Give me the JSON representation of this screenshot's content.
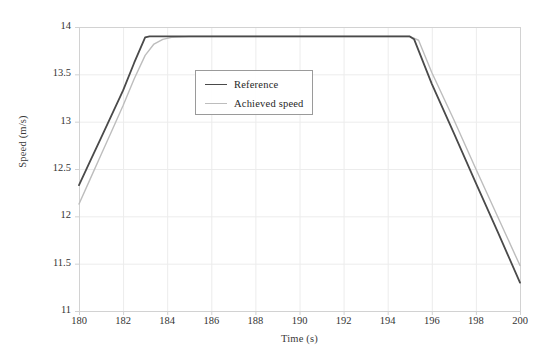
{
  "chart_data": {
    "type": "line",
    "title": "",
    "xlabel": "Time (s)",
    "ylabel": "Speed (m/s)",
    "xlim": [
      180,
      200
    ],
    "ylim": [
      11,
      14
    ],
    "xticks": [
      180,
      182,
      184,
      186,
      188,
      190,
      192,
      194,
      196,
      198,
      200
    ],
    "xtick_labels": [
      "180",
      "182",
      "184",
      "186",
      "188",
      "190",
      "192",
      "194",
      "196",
      "198",
      "200"
    ],
    "yticks": [
      11,
      11.5,
      12,
      12.5,
      13,
      13.5,
      14
    ],
    "ytick_labels": [
      "11",
      "11.5",
      "12",
      "12.5",
      "13",
      "13.5",
      "14"
    ],
    "grid": true,
    "legend_position": "upper center",
    "series": [
      {
        "name": "Reference",
        "color": "#4a4a4a",
        "width": 1.8,
        "x": [
          180,
          180.5,
          181,
          181.5,
          182,
          182.5,
          183,
          183.2,
          184,
          185,
          186,
          187,
          188,
          189,
          190,
          191,
          192,
          193,
          194,
          195,
          195.2,
          196,
          197,
          198,
          199,
          200
        ],
        "y": [
          12.33,
          12.58,
          12.83,
          13.08,
          13.33,
          13.62,
          13.89,
          13.9,
          13.9,
          13.9,
          13.9,
          13.9,
          13.9,
          13.9,
          13.9,
          13.9,
          13.9,
          13.9,
          13.9,
          13.9,
          13.87,
          13.4,
          12.88,
          12.35,
          11.83,
          11.3
        ]
      },
      {
        "name": "Achieved speed",
        "color": "#bdbdbd",
        "width": 1.4,
        "x": [
          180,
          180.5,
          181,
          181.5,
          182,
          182.5,
          183,
          183.4,
          183.8,
          184.2,
          185,
          186,
          187,
          188,
          189,
          190,
          191,
          192,
          193,
          194,
          195,
          195.4,
          196,
          197,
          198,
          199,
          200
        ],
        "y": [
          12.13,
          12.39,
          12.65,
          12.91,
          13.17,
          13.45,
          13.7,
          13.82,
          13.87,
          13.89,
          13.9,
          13.9,
          13.9,
          13.9,
          13.9,
          13.9,
          13.9,
          13.9,
          13.9,
          13.9,
          13.9,
          13.86,
          13.52,
          13.02,
          12.5,
          11.99,
          11.48
        ]
      }
    ],
    "colors": {
      "grid": "#ececec",
      "axis": "#d2d2d2",
      "text": "#333333",
      "reference": "#4a4a4a",
      "achieved": "#bdbdbd",
      "legend_border": "#9a9a9a",
      "background": "#ffffff"
    },
    "plot_area": {
      "left": 79,
      "top": 27,
      "right": 520,
      "bottom": 311
    }
  },
  "legend": {
    "items": [
      {
        "label": "Reference"
      },
      {
        "label": "Achieved speed"
      }
    ]
  }
}
